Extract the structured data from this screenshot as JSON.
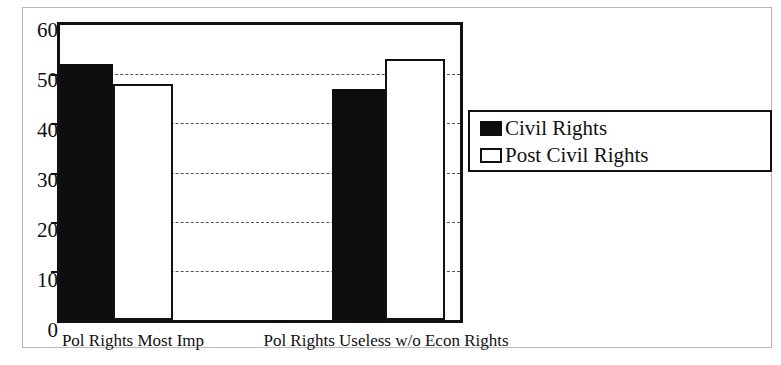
{
  "chart_data": {
    "type": "bar",
    "title": "",
    "xlabel": "",
    "ylabel": "",
    "ylim": [
      0,
      60
    ],
    "ytick_step": 10,
    "yticks": [
      "0",
      "10",
      "20",
      "30",
      "40",
      "50",
      "60"
    ],
    "gridlines": [
      10,
      20,
      30,
      40,
      50
    ],
    "grid": true,
    "grid_style": "dashed",
    "legend_position": "right",
    "categories": [
      "Pol Rights Most Imp",
      "Pol Rights Useless w/o Econ Rights"
    ],
    "series": [
      {
        "name": "Civil Rights",
        "color": "#0d0d0d",
        "fill": "solid-black",
        "values": [
          52,
          47
        ]
      },
      {
        "name": "Post Civil Rights",
        "color": "#ffffff",
        "fill": "white-outlined",
        "values": [
          48,
          53
        ]
      }
    ]
  },
  "legend": {
    "items": [
      {
        "label": "Civil Rights",
        "swatch": "black-filled-swatch"
      },
      {
        "label": "Post Civil Rights",
        "swatch": "white-outlined-swatch"
      }
    ]
  },
  "axes": {
    "y_tick_labels": [
      "60",
      "50",
      "40",
      "30",
      "20",
      "10",
      "0"
    ]
  },
  "x_axis": {
    "labels": [
      "Pol Rights Most Imp",
      "Pol Rights Useless w/o Econ Rights"
    ]
  }
}
